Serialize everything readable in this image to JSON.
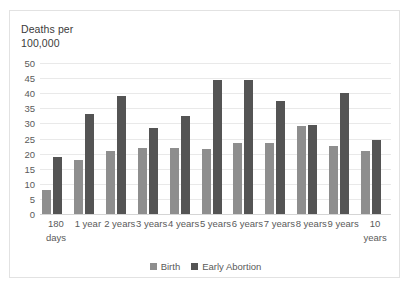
{
  "chart_data": {
    "type": "bar",
    "title": "",
    "ylabel": "Deaths per\n100,000",
    "xlabel": "",
    "ylim": [
      0,
      50
    ],
    "ytick_step": 5,
    "yticks": [
      "0",
      "5",
      "10",
      "15",
      "20",
      "25",
      "30",
      "35",
      "40",
      "45",
      "50"
    ],
    "grid": true,
    "legend_position": "bottom",
    "categories": [
      "180\ndays",
      "1 year",
      "2 years",
      "3 years",
      "4 years",
      "5 years",
      "6 years",
      "7 years",
      "8 years",
      "9 years",
      "10\nyears"
    ],
    "series": [
      {
        "name": "Birth",
        "color": "#8e8e8e",
        "values": [
          8,
          18,
          21,
          22,
          22,
          21.5,
          23.5,
          23.5,
          29,
          22.5,
          21
        ]
      },
      {
        "name": "Early Abortion",
        "color": "#545454",
        "values": [
          19,
          33,
          39,
          28.5,
          32.5,
          44.5,
          44.5,
          37.5,
          29.5,
          40,
          24.5
        ]
      }
    ]
  },
  "frame": {
    "border_color": "#e2e2e2",
    "background": "#ffffff",
    "gridline_color": "#e9e9e9",
    "text_color": "#5a5a5a"
  }
}
